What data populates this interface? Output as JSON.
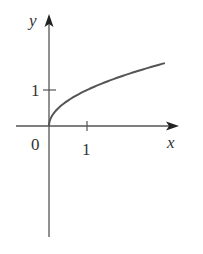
{
  "chart_data": {
    "type": "line",
    "title": "",
    "function": "y = sqrt(x)",
    "xlabel": "x",
    "ylabel": "y",
    "origin_label": "0",
    "x_ticks": [
      {
        "value": 1,
        "label": "1"
      }
    ],
    "y_ticks": [
      {
        "value": 1,
        "label": "1"
      }
    ],
    "xlim": [
      -0.9,
      3.4
    ],
    "ylim": [
      -3.1,
      3.1
    ],
    "grid": false,
    "legend": null,
    "series": [
      {
        "name": "y = sqrt(x)",
        "x": [
          0,
          0.05,
          0.1,
          0.25,
          0.5,
          0.75,
          1,
          1.5,
          2,
          2.5,
          3.05
        ],
        "y": [
          0,
          0.224,
          0.316,
          0.5,
          0.707,
          0.866,
          1,
          1.225,
          1.414,
          1.581,
          1.746
        ]
      }
    ]
  },
  "colors": {
    "axis": "#555555",
    "curve": "#555555",
    "text": "#333333",
    "background": "#ffffff"
  }
}
